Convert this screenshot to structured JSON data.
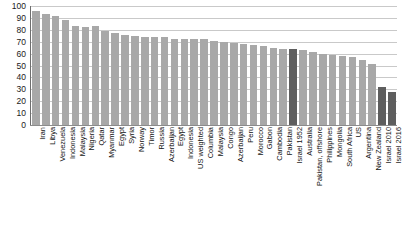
{
  "chart_data": {
    "type": "bar",
    "title": "",
    "subtitle": "",
    "xlabel": "",
    "ylabel": "",
    "ylim": [
      0,
      100
    ],
    "yticks": [
      0,
      10,
      20,
      30,
      40,
      50,
      60,
      70,
      80,
      90,
      100
    ],
    "grid": true,
    "legend": "none",
    "orientation": "vertical",
    "sorted": "descending",
    "categories": [
      "Iran",
      "Libya",
      "Venezuela",
      "Indonesia",
      "Malaysia",
      "Nigeria",
      "Qatar",
      "Myanmar",
      "Egypt",
      "Syria",
      "Norway",
      "Timor",
      "Russia",
      "Azerbaijan",
      "Egypt",
      "Indonesia",
      "US weighted",
      "Columbia",
      "Malaysia",
      "Congo",
      "Azerbaijan",
      "Peru",
      "Morocco",
      "Gabon",
      "Cambodia",
      "Pakistan",
      "Israel 1952",
      "Australia",
      "Pakistan, offshore",
      "Philippines",
      "Mongolia",
      "South Africa",
      "US",
      "Argentina",
      "New Zealand",
      "Israel 2010",
      "Israel 2016"
    ],
    "values": [
      96,
      93,
      92,
      88,
      83,
      82,
      83,
      79,
      77,
      76,
      75,
      74,
      74,
      74,
      72,
      72,
      72,
      72,
      71,
      70,
      69,
      68,
      67,
      66,
      65,
      64,
      64,
      63,
      61,
      60,
      59,
      58,
      57,
      55,
      51,
      32,
      28
    ],
    "highlighted": [
      "Israel 1952",
      "Israel 2010",
      "Israel 2016"
    ],
    "colors": {
      "bar": "#a8a8a8",
      "bar_highlight": "#5e5e5e",
      "gridline": "#c9c9c9",
      "axis": "#6e6e6e",
      "text": "#111111",
      "background": "#ffffff"
    }
  }
}
